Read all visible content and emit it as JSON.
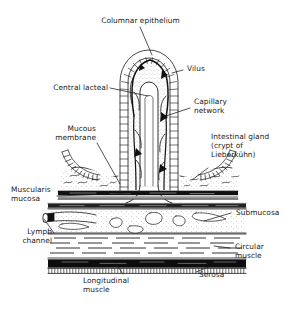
{
  "figure": {
    "type": "anatomical-line-diagram",
    "style": "black-and-white ink line drawing",
    "background_color": "#ffffff",
    "line_color": "#1a1a1a"
  },
  "labels": {
    "columnar_epithelium": "Columnar epithelium",
    "vilus": "Vilus",
    "central_lacteal": "Central lacteal",
    "capillary_network_line1": "Capillary",
    "capillary_network_line2": "network",
    "mucous_membrane_line1": "Mucous",
    "mucous_membrane_line2": "membrane",
    "intestinal_gland_line1": "Intestinal gland",
    "intestinal_gland_line2": "(crypt of",
    "intestinal_gland_line3": "Lieberkühn)",
    "muscularis_mucosa_line1": "Muscularis",
    "muscularis_mucosa_line2": "mucosa",
    "submucosa": "Submucosa",
    "lymph_channel_line1": "Lymph",
    "lymph_channel_line2": "channel",
    "circular_muscle_line1": "Circular",
    "circular_muscle_line2": "muscle",
    "serosa": "Serosa",
    "longitudinal_muscle_line1": "Longitudinal",
    "longitudinal_muscle_line2": "muscle"
  },
  "structures": [
    "columnar epithelium",
    "vilus",
    "central lacteal",
    "capillary network",
    "mucous membrane",
    "intestinal gland (crypt of Lieberkühn)",
    "muscularis mucosa",
    "submucosa",
    "lymph channel",
    "circular muscle",
    "serosa",
    "longitudinal muscle"
  ]
}
